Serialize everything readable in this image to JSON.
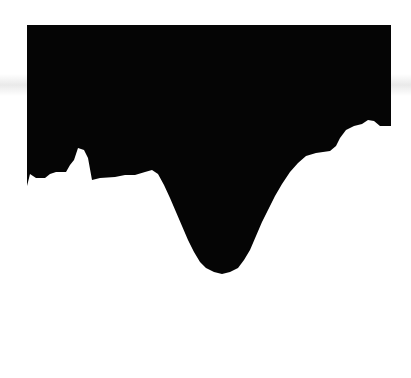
{
  "canvas": {
    "width": 411,
    "height": 378,
    "background": "#ffffff"
  },
  "shape": {
    "fill": "#050505",
    "top_edge_y": 25,
    "left_x": 27,
    "right_x": 391,
    "bottom_profile": [
      [
        27,
        186
      ],
      [
        30,
        174
      ],
      [
        36,
        178
      ],
      [
        45,
        178
      ],
      [
        50,
        174
      ],
      [
        56,
        172
      ],
      [
        66,
        172
      ],
      [
        70,
        165
      ],
      [
        74,
        160
      ],
      [
        78,
        148
      ],
      [
        84,
        150
      ],
      [
        88,
        158
      ],
      [
        92,
        180
      ],
      [
        100,
        178
      ],
      [
        115,
        177
      ],
      [
        125,
        175
      ],
      [
        135,
        175
      ],
      [
        145,
        172
      ],
      [
        152,
        170
      ],
      [
        158,
        174
      ],
      [
        164,
        185
      ],
      [
        170,
        198
      ],
      [
        176,
        212
      ],
      [
        182,
        226
      ],
      [
        188,
        240
      ],
      [
        194,
        252
      ],
      [
        200,
        262
      ],
      [
        206,
        268
      ],
      [
        214,
        272
      ],
      [
        222,
        274
      ],
      [
        230,
        272
      ],
      [
        238,
        268
      ],
      [
        244,
        260
      ],
      [
        250,
        250
      ],
      [
        256,
        236
      ],
      [
        262,
        222
      ],
      [
        268,
        210
      ],
      [
        275,
        196
      ],
      [
        282,
        184
      ],
      [
        290,
        172
      ],
      [
        298,
        163
      ],
      [
        306,
        156
      ],
      [
        316,
        153
      ],
      [
        330,
        151
      ],
      [
        336,
        146
      ],
      [
        340,
        138
      ],
      [
        346,
        130
      ],
      [
        354,
        126
      ],
      [
        362,
        124
      ],
      [
        368,
        120
      ],
      [
        374,
        121
      ],
      [
        380,
        126
      ],
      [
        391,
        126
      ]
    ]
  }
}
